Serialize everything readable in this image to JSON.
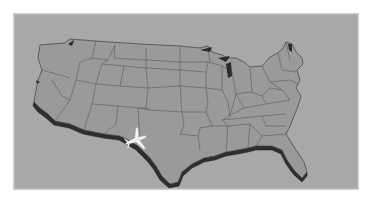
{
  "image": {
    "subject": "3D extruded map of the contiguous United States with state borders and an airplane over West Texas",
    "colors": {
      "page_background": "#ffffff",
      "frame_background": "#a8a8a8",
      "map_surface": "#9a9a9a",
      "state_border": "#555555",
      "extrusion_side": "#2e2e2e",
      "airplane": "#f4f4f4"
    },
    "corner_text": "· · ·  · ·"
  },
  "map": {
    "outline": "M40,45 L65,43 L70,39 L95,41 L140,44 L180,46 L200,48 L208,46 L212,52 L222,55 L228,58 L236,58 L244,62 L250,67 L262,66 L270,57 L278,53 L283,48 L286,42 L292,44 L296,52 L302,58 L303,64 L297,70 L300,80 L296,88 L301,96 L298,106 L294,116 L290,126 L286,134 L296,150 L304,162 L307,172 L302,178 L294,170 L287,160 L282,150 L272,146 L256,146 L248,148 L238,150 L226,152 L215,156 L204,158 L192,164 L182,172 L178,182 L170,184 L162,176 L156,166 L150,158 L144,152 L138,146 L130,141 L120,136 L104,134 L84,130 L70,124 L55,121 L48,114 L40,108 L34,102 L36,90 L38,80 L42,70 L38,58 Z",
    "extrusion": "M34,102 L40,108 L48,114 L55,121 L70,124 L84,130 L104,134 L120,136 L130,141 L138,146 L144,152 L150,158 L156,166 L162,176 L170,184 L178,182 L182,172 L192,164 L204,158 L215,156 L226,152 L238,150 L248,148 L256,146 L272,146 L282,150 L287,160 L294,170 L302,178 L307,172 L307,176 L302,182 L293,174 L286,164 L281,154 L272,150 L256,150 L248,152 L238,154 L226,156 L215,160 L204,162 L192,168 L183,176 L179,186 L169,188 L160,180 L154,170 L148,162 L142,156 L136,150 L128,145 L119,140 L103,138 L83,134 L69,128 L54,125 L46,118 L38,112 L33,106 Z",
    "borders": [
      "M96,41 L92,58 L80,62 L76,80 L70,100 L55,121",
      "M42,70 L70,78",
      "M92,58 L108,60",
      "M70,100 L62,96 L52,80",
      "M76,80 L96,84 L102,64 L108,60 L115,45",
      "M96,84 L92,104 L84,130",
      "M92,104 L118,106 L138,108",
      "M102,64 L124,66 L120,86 L96,84",
      "M120,86 L148,88 L146,108 L138,108",
      "M124,66 L146,68 L148,88",
      "M146,68 L180,70 L180,86 L148,88",
      "M115,45 L114,58 L146,60 L146,68",
      "M146,60 L180,62 L180,70",
      "M146,48 L146,60",
      "M180,46 L180,62",
      "M118,106 L116,124 L104,134",
      "M138,108 L150,110 L146,108",
      "M150,110 L182,112 L184,126 L180,134 L198,136 L200,150",
      "M138,108 L140,144",
      "M180,86 L182,112",
      "M180,86 L206,88 L208,102 L206,112 L182,112",
      "M180,70 L206,72 L206,88",
      "M180,62 L208,62 L206,72",
      "M208,46 L210,62",
      "M206,112 L212,126 L200,128 L198,136",
      "M212,126 L228,126 L226,152",
      "M206,88 L222,90 L228,102 L230,116 L222,120 L228,126",
      "M208,62 L222,66 L222,90",
      "M222,66 L232,72 L236,94 L230,116",
      "M236,94 L244,108 L232,114",
      "M228,126 L250,124 L248,148",
      "M222,120 L262,116 L286,114",
      "M244,108 L266,104 L290,100",
      "M236,94 L250,92 L262,96 L266,104",
      "M250,67 L252,92",
      "M262,96 L270,88 L282,90 L290,100",
      "M262,66 L270,82 L282,90",
      "M270,82 L290,80 L298,84",
      "M250,124 L262,136 L256,146",
      "M262,136 L286,134",
      "M262,116 L266,126 L286,126",
      "M278,53 L282,70 L296,72",
      "M286,42 L290,60"
    ],
    "lakes": [
      "M68,44 L74,40 L72,46 Z",
      "M200,50 L212,47 L210,52 Z",
      "M218,58 L230,56 L226,62 Z",
      "M226,64 L231,62 L232,76 L228,78 Z",
      "M288,44 L292,44 L292,52 L289,50 Z",
      "M36,80 L40,82 L37,84 Z"
    ],
    "airplane": {
      "x": 136,
      "y": 140,
      "rotation": -20
    }
  }
}
